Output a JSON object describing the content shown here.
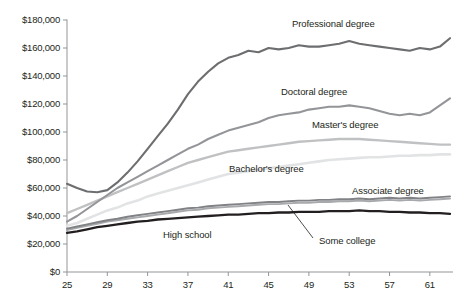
{
  "chart_data": {
    "type": "line",
    "title": "",
    "xlabel": "",
    "ylabel": "",
    "xlim": [
      25,
      63
    ],
    "ylim": [
      0,
      180000
    ],
    "grid": false,
    "legend": "inline-labels",
    "xticks": [
      25,
      29,
      33,
      37,
      41,
      45,
      49,
      53,
      57,
      61
    ],
    "xticklabels": [
      "25",
      "29",
      "33",
      "37",
      "41",
      "45",
      "49",
      "53",
      "57",
      "61"
    ],
    "yticks": [
      0,
      20000,
      40000,
      60000,
      80000,
      100000,
      120000,
      140000,
      160000,
      180000
    ],
    "yticklabels": [
      "$0",
      "$20,000",
      "$40,000",
      "$60,000",
      "$80,000",
      "$100,000",
      "$120,000",
      "$140,000",
      "$160,000",
      "$180,000"
    ],
    "x": [
      25,
      26,
      27,
      28,
      29,
      30,
      31,
      32,
      33,
      34,
      35,
      36,
      37,
      38,
      39,
      40,
      41,
      42,
      43,
      44,
      45,
      46,
      47,
      48,
      49,
      50,
      51,
      52,
      53,
      54,
      55,
      56,
      57,
      58,
      59,
      60,
      61,
      62,
      63
    ],
    "series": [
      {
        "name": "Professional degree",
        "color": "#6d6e70",
        "width": 2.1,
        "values": [
          63000,
          60000,
          57500,
          57000,
          58500,
          64000,
          71000,
          79000,
          88000,
          97000,
          106000,
          116000,
          127000,
          136000,
          143000,
          149000,
          153000,
          155000,
          158000,
          157000,
          160000,
          159000,
          160000,
          162000,
          161000,
          161000,
          162000,
          163000,
          165000,
          163000,
          162000,
          161000,
          160000,
          159000,
          158000,
          160000,
          159000,
          161000,
          167000
        ]
      },
      {
        "name": "Doctoral degree",
        "color": "#939598",
        "width": 2.1,
        "values": [
          36000,
          40000,
          45000,
          50000,
          55000,
          60000,
          64000,
          68000,
          72000,
          76000,
          80000,
          84000,
          88000,
          91000,
          95000,
          98000,
          101000,
          103000,
          105000,
          107000,
          110000,
          112000,
          113000,
          114000,
          116000,
          117000,
          118000,
          118000,
          119000,
          118000,
          117000,
          115000,
          113000,
          112000,
          113000,
          112000,
          114000,
          119000,
          124000
        ]
      },
      {
        "name": "Master's degree",
        "color": "#c0c1c3",
        "width": 2.4,
        "values": [
          42000,
          45000,
          48000,
          51000,
          54000,
          57000,
          60000,
          63000,
          66000,
          69000,
          72000,
          75000,
          78000,
          80000,
          82000,
          84000,
          86000,
          87000,
          88000,
          89000,
          90000,
          91000,
          92000,
          93000,
          93500,
          94000,
          94500,
          95000,
          95000,
          95000,
          94500,
          94000,
          93500,
          93000,
          92500,
          92000,
          91500,
          91000,
          91000
        ]
      },
      {
        "name": "Bachelor's degree",
        "color": "#e2e3e4",
        "width": 2.6,
        "values": [
          33000,
          35000,
          38000,
          41000,
          44000,
          46000,
          49000,
          51000,
          54000,
          56000,
          58000,
          60000,
          62000,
          64000,
          66000,
          68000,
          70000,
          71000,
          72000,
          73000,
          74000,
          75000,
          76000,
          77000,
          78000,
          79000,
          80000,
          80500,
          81000,
          81500,
          82000,
          82000,
          82500,
          83000,
          83000,
          83500,
          83500,
          84000,
          84000
        ]
      },
      {
        "name": "Associate degree",
        "color": "#808285",
        "width": 1.9,
        "values": [
          31000,
          32500,
          34000,
          35500,
          37000,
          38000,
          39500,
          40500,
          41500,
          42500,
          43500,
          44500,
          45500,
          46000,
          47000,
          47500,
          48000,
          48500,
          49000,
          49500,
          50000,
          50000,
          50500,
          51000,
          51000,
          51500,
          51500,
          52000,
          52000,
          52500,
          52000,
          52500,
          53000,
          52500,
          53000,
          52500,
          53000,
          53500,
          54000
        ]
      },
      {
        "name": "Some college",
        "color": "#a7a9ac",
        "width": 1.9,
        "values": [
          30000,
          31500,
          33000,
          34500,
          36000,
          37000,
          38000,
          39000,
          40000,
          41000,
          42000,
          43000,
          44000,
          44500,
          45500,
          46000,
          46500,
          47000,
          47500,
          48000,
          48500,
          48500,
          49000,
          49500,
          49500,
          50000,
          50000,
          50500,
          50500,
          51000,
          50500,
          51000,
          51500,
          51000,
          51500,
          51000,
          51500,
          52000,
          52500
        ]
      },
      {
        "name": "High school",
        "color": "#231f20",
        "width": 2.3,
        "values": [
          28000,
          29000,
          30500,
          32000,
          33000,
          34000,
          35000,
          36000,
          36500,
          37500,
          38000,
          38500,
          39000,
          39500,
          40000,
          40500,
          41000,
          41000,
          41500,
          42000,
          42000,
          42500,
          42500,
          43000,
          43000,
          43000,
          43500,
          43500,
          43500,
          44000,
          43500,
          43500,
          43000,
          43000,
          42500,
          42500,
          42000,
          42000,
          41500
        ]
      }
    ],
    "annotations": [
      {
        "name": "professional-degree-label",
        "text": "Professional degree",
        "x": 292,
        "y": 18,
        "align": "left"
      },
      {
        "name": "doctoral-degree-label",
        "text": "Doctoral degree",
        "x": 281,
        "y": 86,
        "align": "left"
      },
      {
        "name": "masters-degree-label",
        "text": "Master's degree",
        "x": 312,
        "y": 119,
        "align": "left"
      },
      {
        "name": "bachelors-degree-label",
        "text": "Bachelor's degree",
        "x": 229,
        "y": 163,
        "align": "left"
      },
      {
        "name": "associate-degree-label",
        "text": "Associate degree",
        "x": 352,
        "y": 185,
        "align": "left"
      },
      {
        "name": "some-college-label",
        "text": "Some college",
        "x": 319,
        "y": 235,
        "align": "left"
      },
      {
        "name": "high-school-label",
        "text": "High school",
        "x": 163,
        "y": 229,
        "align": "left"
      }
    ],
    "leader_lines": [
      {
        "name": "some-college-leader",
        "x1": 313,
        "y1": 238,
        "x2": 288,
        "y2": 205
      }
    ]
  },
  "axis": {
    "axis_color": "#939598",
    "plot_left": 67,
    "plot_right": 450,
    "plot_top": 20,
    "plot_bottom": 272
  }
}
